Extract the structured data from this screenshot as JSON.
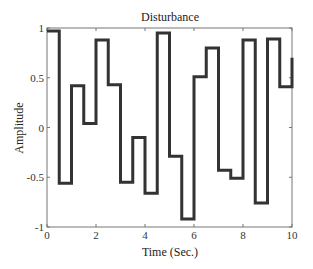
{
  "chart_data": {
    "type": "line",
    "title": "Disturbance",
    "xlabel": "Time (Sec.)",
    "ylabel": "Amplitude",
    "xlim": [
      0,
      10
    ],
    "ylim": [
      -1,
      1
    ],
    "grid": false,
    "legend": null,
    "xticks": [
      0,
      2,
      4,
      6,
      8,
      10
    ],
    "xtick_labels": [
      "0",
      "2",
      "4",
      "6",
      "8",
      "10"
    ],
    "yticks": [
      -1,
      -0.5,
      0,
      0.5,
      1
    ],
    "ytick_labels": [
      "-1",
      "-0.5",
      "0",
      "0.5",
      "1"
    ],
    "step": "post",
    "series": [
      {
        "name": "Disturbance",
        "color": "#333333",
        "x": [
          0,
          0.5,
          1.0,
          1.5,
          2.0,
          2.5,
          3.0,
          3.5,
          4.0,
          4.5,
          5.0,
          5.5,
          6.0,
          6.5,
          7.0,
          7.5,
          8.0,
          8.5,
          9.0,
          9.5,
          10.0
        ],
        "values": [
          0.97,
          -0.56,
          0.42,
          0.04,
          0.88,
          0.43,
          -0.55,
          -0.1,
          -0.66,
          0.95,
          -0.29,
          -0.92,
          0.51,
          0.8,
          -0.43,
          -0.51,
          0.88,
          -0.76,
          0.89,
          0.41,
          0.7
        ]
      }
    ]
  }
}
